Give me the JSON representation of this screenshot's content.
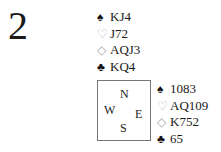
{
  "problem_number": "2",
  "north": {
    "spades": {
      "symbol": "♠",
      "cards": "KJ4"
    },
    "hearts": {
      "symbol": "♡",
      "cards": "J72"
    },
    "diamonds": {
      "symbol": "◇",
      "cards": "AQJ3"
    },
    "clubs": {
      "symbol": "♣",
      "cards": "KQ4"
    }
  },
  "east": {
    "spades": {
      "symbol": "♠",
      "cards": "1083"
    },
    "hearts": {
      "symbol": "♡",
      "cards": "AQ109"
    },
    "diamonds": {
      "symbol": "◇",
      "cards": "K752"
    },
    "clubs": {
      "symbol": "♣",
      "cards": "65"
    }
  },
  "compass": {
    "n": "N",
    "w": "W",
    "e": "E",
    "s": "S"
  }
}
